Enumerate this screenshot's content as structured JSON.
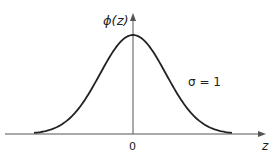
{
  "chart_data": {
    "type": "line",
    "title": "",
    "xlabel": "z",
    "ylabel": "ϕ(z)",
    "x_ticks": [
      "0"
    ],
    "annotation": "σ = 1",
    "series": [
      {
        "name": "standard normal pdf",
        "x": [
          -3,
          -2.5,
          -2,
          -1.5,
          -1,
          -0.5,
          0,
          0.5,
          1,
          1.5,
          2,
          2.5,
          3
        ],
        "values": [
          0.0044,
          0.0175,
          0.054,
          0.1295,
          0.242,
          0.3521,
          0.3989,
          0.3521,
          0.242,
          0.1295,
          0.054,
          0.0175,
          0.0044
        ]
      }
    ],
    "xlim": [
      -4,
      4
    ],
    "ylim": [
      0,
      0.45
    ],
    "grid": false,
    "legend": "none"
  },
  "labels": {
    "y_axis": "ϕ(z)",
    "x_axis": "z",
    "origin_tick": "0",
    "sigma_label": "σ = 1"
  }
}
